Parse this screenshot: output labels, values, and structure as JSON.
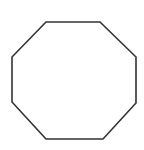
{
  "canvas": {
    "width": 144,
    "height": 150,
    "background_color": "#ffffff",
    "title": "Octagon"
  },
  "shape": {
    "name": "octagon",
    "sides": 8,
    "type": "regular-polygon",
    "fill_color": "#ffffff",
    "stroke_color": "#333333",
    "stroke_width": 1.6,
    "vertices": [
      [
        46,
        22
      ],
      [
        100,
        22
      ],
      [
        136,
        57
      ],
      [
        136,
        103
      ],
      [
        103,
        139
      ],
      [
        46,
        139
      ],
      [
        12,
        102
      ],
      [
        12,
        57
      ]
    ],
    "points_attr": "46,22 100,22 136,57 136,103 103,139 46,139 12,102 12,57"
  }
}
